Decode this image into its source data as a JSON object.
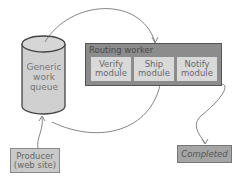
{
  "diagram": {
    "queue": {
      "label_line1": "Generic",
      "label_line2": "work",
      "label_line3": "queue"
    },
    "router": {
      "title": "Routing worker",
      "modules": [
        {
          "line1": "Verify",
          "line2": "module"
        },
        {
          "line1": "Ship",
          "line2": "module"
        },
        {
          "line1": "Notify",
          "line2": "module"
        }
      ]
    },
    "producer": {
      "line1": "Producer",
      "line2": "(web site)"
    },
    "completed": {
      "label": "Completed"
    },
    "colors": {
      "queue_fill": "#d0d0d0",
      "router_fill": "#8c8c8c",
      "module_fill": "#d9d9d9",
      "producer_fill": "#c9c9c9",
      "completed_fill": "#a5a5a5",
      "line": "#555555"
    }
  }
}
